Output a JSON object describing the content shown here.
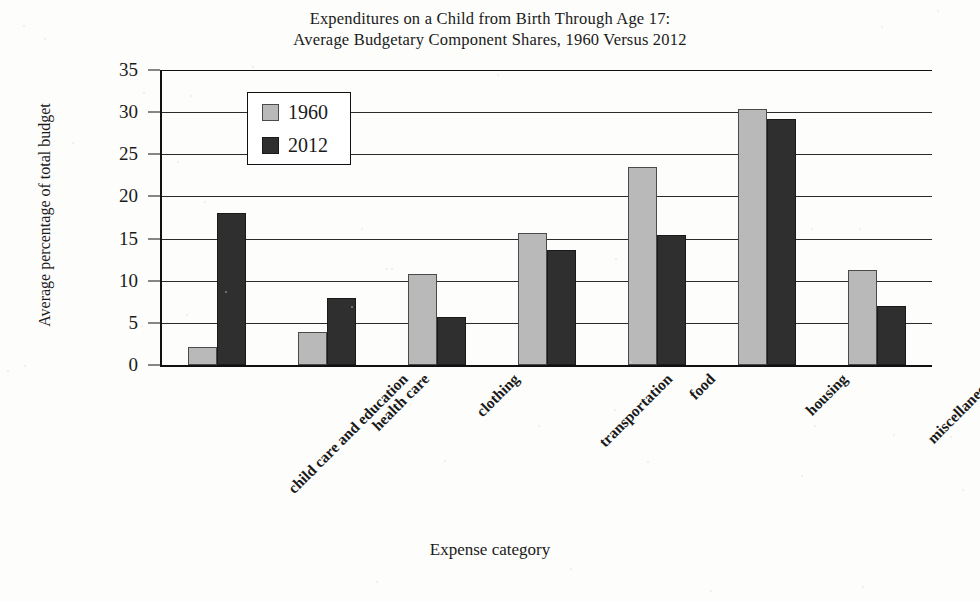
{
  "chart_data": {
    "type": "bar",
    "title": "Expenditures on a Child from Birth Through Age 17: Average Budgetary Component Shares, 1960 Versus 2012",
    "title_lines": [
      "Expenditures on a Child from Birth Through Age 17:",
      "Average Budgetary Component Shares, 1960 Versus 2012"
    ],
    "xlabel": "Expense category",
    "ylabel": "Average percentage of total budget",
    "ylim": [
      0,
      35
    ],
    "yticks": [
      0,
      5,
      10,
      15,
      20,
      25,
      30,
      35
    ],
    "grid": true,
    "legend_position": "upper-left-inside",
    "categories": [
      "child care and education",
      "health care",
      "clothing",
      "transportation",
      "food",
      "housing",
      "miscellaneous"
    ],
    "series": [
      {
        "name": "1960",
        "color": "#b9b9b9",
        "values": [
          1.9,
          3.7,
          10.6,
          15.4,
          23.2,
          30.1,
          11.0
        ]
      },
      {
        "name": "2012",
        "color": "#2f2f2f",
        "values": [
          17.8,
          7.7,
          5.5,
          13.4,
          15.2,
          29.0,
          6.8
        ]
      }
    ]
  },
  "legend": {
    "items": [
      {
        "label": "1960",
        "swatch": "light-gray-swatch"
      },
      {
        "label": "2012",
        "swatch": "dark-gray-swatch"
      }
    ]
  }
}
